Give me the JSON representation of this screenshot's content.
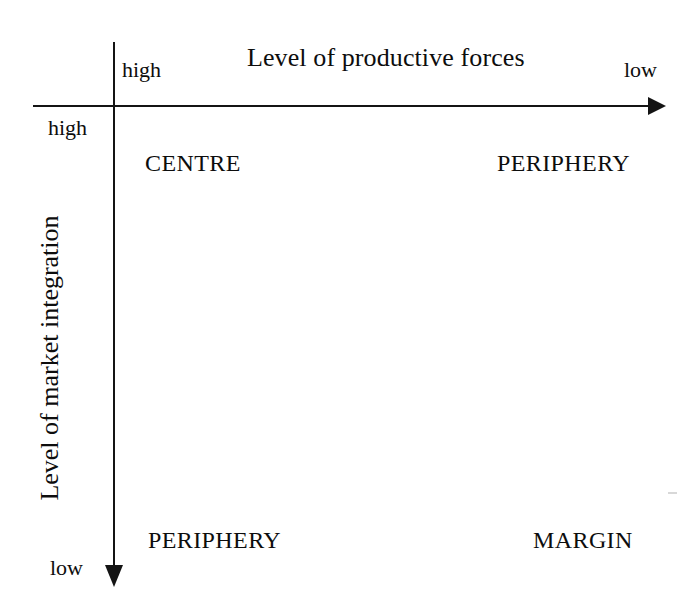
{
  "diagram": {
    "type": "two-by-two-matrix",
    "background_color": "#ffffff",
    "line_color": "#141414",
    "text_color": "#0d0d0d",
    "x_axis": {
      "title": "Level of productive forces",
      "start_label": "high",
      "end_label": "low",
      "direction": "left-to-right",
      "arrow": "right"
    },
    "y_axis": {
      "title": "Level of market integration",
      "start_label": "high",
      "end_label": "low",
      "direction": "top-to-bottom",
      "arrow": "down",
      "rotation": "-90deg"
    },
    "quadrants": [
      {
        "id": "top-left",
        "label": "CENTRE",
        "x": "high",
        "y": "high"
      },
      {
        "id": "top-right",
        "label": "PERIPHERY",
        "x": "low",
        "y": "high"
      },
      {
        "id": "bottom-left",
        "label": "PERIPHERY",
        "x": "high",
        "y": "low"
      },
      {
        "id": "bottom-right",
        "label": "MARGIN",
        "x": "low",
        "y": "low"
      }
    ]
  },
  "chart_data": {
    "type": "table",
    "title": "",
    "xlabel": "Level of productive forces",
    "ylabel": "Level of market integration",
    "x_ticks": [
      "high",
      "low"
    ],
    "y_ticks": [
      "high",
      "low"
    ],
    "grid": false,
    "legend": null,
    "categories": [
      "high productive forces",
      "low productive forces"
    ],
    "rows": [
      "high market integration",
      "low market integration"
    ],
    "cells": [
      [
        "CENTRE",
        "PERIPHERY"
      ],
      [
        "PERIPHERY",
        "MARGIN"
      ]
    ]
  }
}
